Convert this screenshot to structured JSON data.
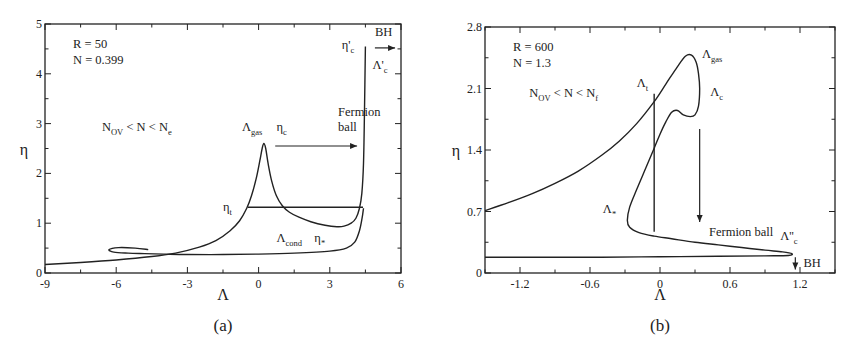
{
  "chart_data": [
    {
      "id": "a",
      "type": "line",
      "caption": "(a)",
      "xlabel": "Λ",
      "ylabel": "η",
      "xlim": [
        -9,
        6
      ],
      "ylim": [
        0,
        5
      ],
      "xticks": [
        -9,
        -6,
        -3,
        0,
        3,
        6
      ],
      "yticks": [
        0,
        1,
        2,
        3,
        4,
        5
      ],
      "xtick_labels": [
        "-9",
        "-6",
        "-3",
        "0",
        "3",
        "6"
      ],
      "ytick_labels": [
        "0",
        "1",
        "2",
        "3",
        "4",
        "5"
      ],
      "grid": false,
      "params": {
        "R": "R = 50",
        "N": "N = 0.399"
      },
      "annotations": [
        {
          "text": "N",
          "sub": "OV",
          "rest": " < N < N",
          "sub2": "e",
          "x": -6.6,
          "y": 2.85
        },
        {
          "text": "Λ",
          "sub": "gas",
          "x": -0.7,
          "y": 2.85
        },
        {
          "text": "η",
          "sub": "c",
          "x": 0.75,
          "y": 2.85
        },
        {
          "text": "Fermion",
          "x": 3.35,
          "y": 3.15
        },
        {
          "text": "ball",
          "x": 3.35,
          "y": 2.85
        },
        {
          "text": "η",
          "sub": "t",
          "x": -1.5,
          "y": 1.25
        },
        {
          "text": "Λ",
          "sub": "cond",
          "x": 0.75,
          "y": 0.62
        },
        {
          "text": "η",
          "sub": "*",
          "x": 2.35,
          "y": 0.62
        },
        {
          "text": "η'",
          "sub": "c",
          "x": 3.5,
          "y": 4.5
        },
        {
          "text": "Λ'",
          "sub": "c",
          "x": 4.8,
          "y": 4.1
        },
        {
          "text": "BH",
          "x": 4.9,
          "y": 4.75
        }
      ],
      "series": [
        {
          "name": "upper branch (gas → peak → fermion ball)",
          "x": [
            -9,
            -7.5,
            -6,
            -4.5,
            -3.5,
            -2.5,
            -1.8,
            -1.2,
            -0.8,
            -0.5,
            -0.3,
            -0.1,
            0.05,
            0.15,
            0.22,
            0.3,
            0.4,
            0.55,
            0.75,
            1.0,
            1.3,
            1.7,
            2.2,
            2.8,
            3.3,
            3.6,
            3.9,
            4.1,
            4.25,
            4.35,
            4.42,
            4.46,
            4.5
          ],
          "y": [
            0.17,
            0.21,
            0.26,
            0.33,
            0.4,
            0.52,
            0.65,
            0.85,
            1.05,
            1.3,
            1.55,
            1.9,
            2.25,
            2.5,
            2.6,
            2.5,
            2.2,
            1.85,
            1.55,
            1.35,
            1.22,
            1.12,
            1.03,
            0.96,
            0.93,
            0.94,
            1.0,
            1.1,
            1.3,
            1.6,
            2.2,
            3.2,
            4.55
          ]
        },
        {
          "name": "lower branch (condensate, spiral)",
          "x": [
            -4.65,
            -5.2,
            -5.9,
            -6.3,
            -6.1,
            -5.5,
            -4.8,
            -4.0,
            -3.0,
            -1.5,
            0,
            1.5,
            3.0,
            3.7,
            4.05,
            4.25,
            4.36,
            4.42
          ],
          "y": [
            0.47,
            0.5,
            0.51,
            0.47,
            0.42,
            0.4,
            0.39,
            0.38,
            0.37,
            0.37,
            0.38,
            0.4,
            0.44,
            0.5,
            0.62,
            0.85,
            1.1,
            1.3
          ]
        },
        {
          "name": "Maxwell construction η_t",
          "x": [
            -0.45,
            4.4
          ],
          "y": [
            1.32,
            1.32
          ]
        }
      ],
      "arrows": [
        {
          "label": "Fermion ball",
          "from": [
            0.7,
            2.55
          ],
          "to": [
            4.15,
            2.55
          ]
        },
        {
          "label": "BH",
          "from": [
            4.9,
            4.52
          ],
          "to": [
            5.75,
            4.52
          ]
        }
      ]
    },
    {
      "id": "b",
      "type": "line",
      "caption": "(b)",
      "xlabel": "Λ",
      "ylabel": "η",
      "xlim": [
        -1.5,
        1.5
      ],
      "ylim": [
        0,
        2.8
      ],
      "xticks": [
        -1.2,
        -0.6,
        0,
        0.6,
        1.2
      ],
      "yticks": [
        0,
        0.7,
        1.4,
        2.1,
        2.8
      ],
      "xtick_labels": [
        "-1.2",
        "-0.6",
        "0",
        "0.6",
        "1.2"
      ],
      "ytick_labels": [
        "0",
        "0.7",
        "1.4",
        "2.1",
        "2.8"
      ],
      "grid": false,
      "params": {
        "R": "R = 600",
        "N": "N = 1.3"
      },
      "annotations": [
        {
          "text": "N",
          "sub": "OV",
          "rest": " < N < N",
          "sub2": "f",
          "x": -1.12,
          "y": 2.0
        },
        {
          "text": "Λ",
          "sub": "gas",
          "x": 0.36,
          "y": 2.45
        },
        {
          "text": "Λ",
          "sub": "t",
          "x": -0.2,
          "y": 2.12
        },
        {
          "text": "Λ",
          "sub": "c",
          "x": 0.43,
          "y": 2.02
        },
        {
          "text": "Λ",
          "sub": "*",
          "x": -0.49,
          "y": 0.68
        },
        {
          "text": "Fermion ball",
          "x": 0.42,
          "y": 0.42
        },
        {
          "text": "Λ''",
          "sub": "c",
          "x": 1.03,
          "y": 0.38
        },
        {
          "text": "BH",
          "x": 1.23,
          "y": 0.07
        }
      ],
      "series": [
        {
          "name": "main curve",
          "x": [
            -1.5,
            -1.3,
            -1.1,
            -0.9,
            -0.7,
            -0.5,
            -0.35,
            -0.2,
            -0.05,
            0.05,
            0.15,
            0.22,
            0.27,
            0.31,
            0.33,
            0.34,
            0.33,
            0.3,
            0.26,
            0.2,
            0.15,
            0.1,
            0.05,
            0.0,
            -0.05,
            -0.12,
            -0.2,
            -0.26,
            -0.28,
            -0.26,
            -0.18,
            -0.05,
            0.1,
            0.3,
            0.5,
            0.7,
            0.9,
            1.05,
            1.13,
            1.1,
            0.9,
            0.5,
            0,
            -0.5,
            -1.0,
            -1.5
          ],
          "y": [
            0.71,
            0.8,
            0.9,
            1.02,
            1.16,
            1.34,
            1.5,
            1.7,
            1.95,
            2.15,
            2.35,
            2.47,
            2.48,
            2.4,
            2.27,
            2.1,
            1.9,
            1.8,
            1.78,
            1.8,
            1.85,
            1.83,
            1.72,
            1.58,
            1.42,
            1.2,
            0.95,
            0.75,
            0.6,
            0.52,
            0.46,
            0.42,
            0.39,
            0.35,
            0.32,
            0.29,
            0.26,
            0.24,
            0.22,
            0.2,
            0.195,
            0.19,
            0.185,
            0.18,
            0.18,
            0.18
          ]
        },
        {
          "name": "vertical construction Λ_t",
          "x": [
            -0.05,
            -0.05
          ],
          "y": [
            2.04,
            0.47
          ]
        }
      ],
      "arrows": [
        {
          "label": "Fermion ball",
          "from": [
            0.34,
            1.64
          ],
          "to": [
            0.34,
            0.58
          ]
        },
        {
          "label": "BH",
          "from": [
            1.16,
            0.18
          ],
          "to": [
            1.16,
            0.04
          ]
        }
      ]
    }
  ]
}
